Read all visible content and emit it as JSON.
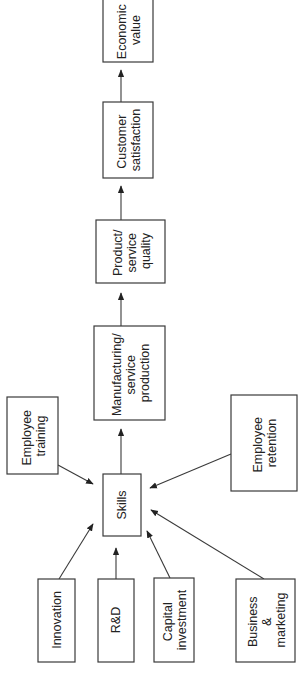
{
  "diagram": {
    "orientation": "rotated-90-ccw",
    "nodes": {
      "economic_value": {
        "lines": [
          "Economic",
          "value"
        ]
      },
      "customer_satisfaction": {
        "lines": [
          "Customer",
          "satisfaction"
        ]
      },
      "product_service_quality": {
        "lines": [
          "Product/",
          "service",
          "quality"
        ]
      },
      "manufacturing_service_production": {
        "lines": [
          "Manufacturing/",
          "service",
          "production"
        ]
      },
      "skills": {
        "lines": [
          "Skills"
        ]
      },
      "employee_training": {
        "lines": [
          "Employee",
          "training"
        ]
      },
      "employee_retention": {
        "lines": [
          "Employee",
          "retention"
        ]
      },
      "innovation": {
        "lines": [
          "Innovation"
        ]
      },
      "rnd": {
        "lines": [
          "R&D"
        ]
      },
      "capital_investment": {
        "lines": [
          "Capital",
          "investment"
        ]
      },
      "business_marketing": {
        "lines": [
          "Business",
          "&",
          "marketing"
        ]
      }
    },
    "edges": [
      {
        "from": "employee_training",
        "to": "skills"
      },
      {
        "from": "employee_retention",
        "to": "skills"
      },
      {
        "from": "innovation",
        "to": "skills"
      },
      {
        "from": "rnd",
        "to": "skills"
      },
      {
        "from": "capital_investment",
        "to": "skills"
      },
      {
        "from": "business_marketing",
        "to": "skills"
      },
      {
        "from": "skills",
        "to": "manufacturing_service_production"
      },
      {
        "from": "manufacturing_service_production",
        "to": "product_service_quality"
      },
      {
        "from": "product_service_quality",
        "to": "customer_satisfaction"
      },
      {
        "from": "customer_satisfaction",
        "to": "economic_value"
      }
    ]
  }
}
